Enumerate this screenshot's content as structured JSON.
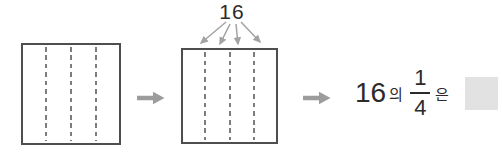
{
  "diagram": {
    "left_square": {
      "parts": 4
    },
    "right_square": {
      "parts": 4,
      "label": "16"
    },
    "expression": {
      "number": "16",
      "of_particle": "의",
      "fraction": {
        "numerator": "1",
        "denominator": "4"
      },
      "topic_particle": "은"
    },
    "colors": {
      "square_border": "#4e4e4e",
      "dashed_divider": "#7d7d7d",
      "block_arrow": "#9c9c9c",
      "fan_arrow": "#a3a3a3",
      "text": "#2b2b2b",
      "answer_box": "#e2e2e2"
    }
  }
}
